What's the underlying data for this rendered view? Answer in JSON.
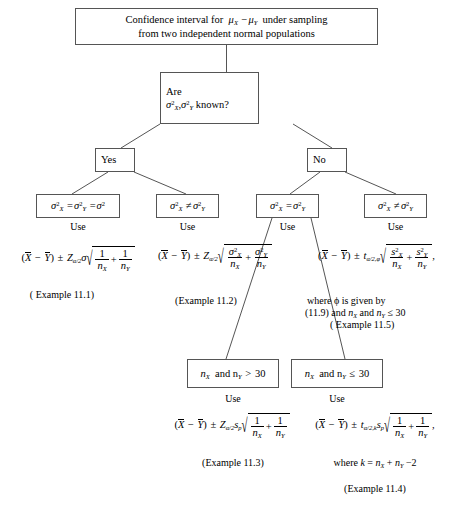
{
  "diagram": {
    "title_line1": "Confidence interval for",
    "title_mu": "μ",
    "title_line1_tail": "under sampling",
    "title_line2": "from two independent normal populations",
    "decision_label": "Are",
    "decision_question_tail": "known?",
    "yes_label": "Yes",
    "no_label": "No",
    "use_label": "Use",
    "and_label": "and",
    "branches": {
      "known_equal": {
        "box_text": "σ²X = σ²Y = σ²",
        "use": "Use",
        "example": "( Example 11.1)"
      },
      "known_unequal": {
        "box_text": "σ²X ≠ σ²Y",
        "use": "Use",
        "example": "(Example 11.2)"
      },
      "unknown_equal": {
        "box_text": "σ²X = σ²Y",
        "use": "Use",
        "sub_large": "nX and nY > 30",
        "sub_small": "nX and nY ≤ 30",
        "large_use": "Use",
        "large_example": "(Example 11.3)",
        "small_use": "Use",
        "small_where": "where k = nX + nY −2",
        "small_example": "(Example 11.4)"
      },
      "unknown_unequal": {
        "box_text": "σ²X ≠ σ²Y",
        "use": "Use",
        "where_phi_line1": "where ϕ is given by",
        "where_phi_line2": "(11.9) and nX and nY ≤ 30",
        "example": "( Example 11.5)"
      }
    },
    "symbols": {
      "sigma": "σ",
      "mu": "μ",
      "phi": "ϕ",
      "plusminus": "±",
      "neq": "≠",
      "leq": "≤",
      "gt": ">",
      "minus": "−",
      "radical": "√",
      "Z": "Z",
      "t": "t",
      "s_p": "sp",
      "alpha_half": "α/2",
      "thirty": "30",
      "two": "2",
      "one": "1",
      "eq_ref": "11.9"
    },
    "colors": {
      "box_border": "#555555",
      "line": "#555555",
      "text": "#000000",
      "background": "#ffffff"
    }
  }
}
